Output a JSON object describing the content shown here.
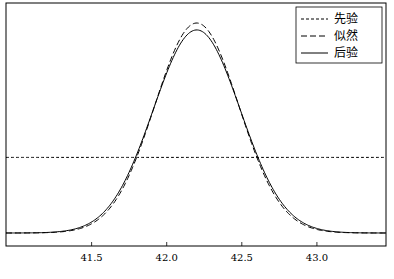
{
  "chart_data": {
    "type": "line",
    "title": "",
    "xlabel": "",
    "ylabel": "",
    "xlim": [
      40.93,
      43.46
    ],
    "x_ticks": [
      41.5,
      42.0,
      42.5,
      43.0
    ],
    "x_tick_labels": [
      "41.5",
      "42.0",
      "42.5",
      "43.0"
    ],
    "y_ticks": [],
    "grid": false,
    "legend_position": "upper right",
    "series": [
      {
        "name": "先验",
        "style": "dashed-short",
        "kind": "constant",
        "value_rel": 0.36
      },
      {
        "name": "似然",
        "style": "dashed-long",
        "kind": "gaussian",
        "mean": 42.2,
        "std": 0.28,
        "peak_rel": 1.0
      },
      {
        "name": "后验",
        "style": "solid",
        "kind": "gaussian",
        "mean": 42.2,
        "std": 0.29,
        "peak_rel": 0.967
      }
    ]
  },
  "legend": {
    "items": [
      {
        "label": "先验"
      },
      {
        "label": "似然"
      },
      {
        "label": "后验"
      }
    ]
  },
  "axis": {
    "ticks": [
      "41.5",
      "42.0",
      "42.5",
      "43.0"
    ]
  }
}
